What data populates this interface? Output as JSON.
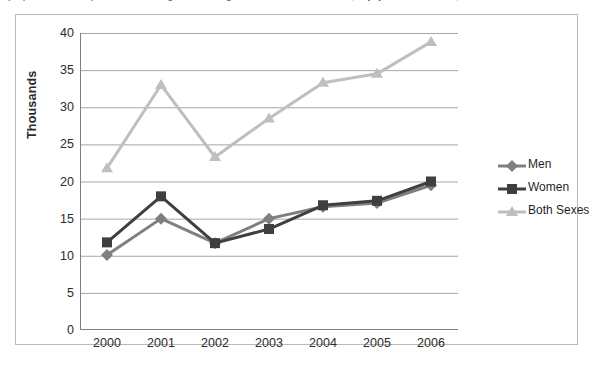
{
  "page": {
    "top_text_fragment": "population of persons living with diagnosed HIV infection, by year and sex, 2000-2006"
  },
  "chart_data": {
    "type": "line",
    "title": "",
    "xlabel": "",
    "ylabel": "Thousands",
    "categories": [
      "2000",
      "2001",
      "2002",
      "2003",
      "2004",
      "2005",
      "2006"
    ],
    "ylim": [
      0,
      40
    ],
    "ytick_step": 5,
    "yticks": [
      "40",
      "35",
      "30",
      "25",
      "20",
      "15",
      "10",
      "5",
      "0"
    ],
    "grid": true,
    "legend_position": "right",
    "series": [
      {
        "name": "Men",
        "color": "#7f7f7f",
        "marker": "diamond",
        "values": [
          10.1,
          15.0,
          11.7,
          15.0,
          16.6,
          17.1,
          19.5
        ]
      },
      {
        "name": "Women",
        "color": "#3f3f3f",
        "marker": "square",
        "values": [
          11.8,
          18.0,
          11.7,
          13.6,
          16.8,
          17.4,
          20.0
        ]
      },
      {
        "name": "Both Sexes",
        "color": "#bfbfbf",
        "marker": "triangle",
        "values": [
          21.8,
          33.0,
          23.3,
          28.5,
          33.3,
          34.5,
          38.8
        ]
      }
    ]
  },
  "colors": {
    "frame": "#b9b9b9",
    "gridline": "#a6a6a6",
    "axis": "#808080",
    "text": "#2b2b2b",
    "background": "#ffffff"
  }
}
